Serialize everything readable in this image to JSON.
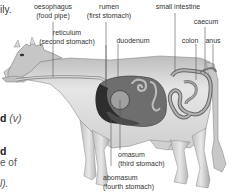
{
  "body_text": {
    "fragment_1": "ily.",
    "fragment_2_bold": "d",
    "fragment_2_italic": "(v)",
    "fragment_3_bold": "d",
    "fragment_4": "e of",
    "fragment_5": "l)."
  },
  "diagram": {
    "labels": {
      "oesophagus": "oesophagus",
      "oesophagus_sub": "(food pipe)",
      "rumen": "rumen",
      "rumen_sub": "(first stomach)",
      "small_intestine": "small intestine",
      "caecum": "caecum",
      "reticulum": "reticulum",
      "reticulum_sub": "(second stomach)",
      "duodenum": "duodenum",
      "colon": "colon",
      "anus": "anus",
      "omasum": "omasum",
      "omasum_sub": "(third stomach)",
      "abomasum": "abomasum",
      "abomasum_sub": "(fourth stomach)"
    },
    "colors": {
      "body": "#d9d9d9",
      "body_shade": "#a8a8a8",
      "rumen": "#6e6e6e",
      "reticulum": "#3a3a3a",
      "omasum": "#9a9a9a",
      "intestine": "#8c8c8c",
      "leader_line": "#555555"
    }
  }
}
